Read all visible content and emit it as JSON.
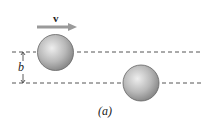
{
  "figure": {
    "velocity_label": "v",
    "impact_parameter_label": "b",
    "caption": "(a)",
    "colors": {
      "arrow": "#9a9a9a",
      "dashed_line": "#555555",
      "sphere_dark": "#7a7a7a",
      "sphere_light": "#e6e6e6"
    }
  }
}
